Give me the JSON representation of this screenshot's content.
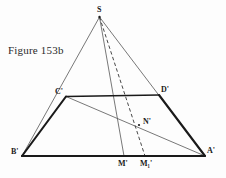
{
  "figure": {
    "caption": "Figure 153b",
    "type": "euclidean-geometry-construction",
    "background_color": "#fdfdfd",
    "stroke_color": "#1a1a1a",
    "thin_stroke_color": "#555555",
    "points": [
      {
        "id": "S",
        "label": "S",
        "x": 99.5,
        "y": 17.0,
        "label_x": 97.0,
        "label_y": 6.0
      },
      {
        "id": "Cp",
        "label": "C'",
        "x": 66.0,
        "y": 96.5,
        "label_x": 55.0,
        "label_y": 88.0
      },
      {
        "id": "Dp",
        "label": "D'",
        "x": 159.0,
        "y": 95.0,
        "label_x": 161.0,
        "label_y": 86.0
      },
      {
        "id": "Bp",
        "label": "B'",
        "x": 22.0,
        "y": 156.0,
        "label_x": 11.0,
        "label_y": 148.0
      },
      {
        "id": "Ap",
        "label": "A'",
        "x": 205.0,
        "y": 156.0,
        "label_x": 207.0,
        "label_y": 147.0
      },
      {
        "id": "Np",
        "label": "N'",
        "x": 139.0,
        "y": 125.0,
        "label_x": 143.0,
        "label_y": 118.0
      },
      {
        "id": "Mp",
        "label": "M'",
        "x": 124.0,
        "y": 156.0,
        "label_x": 118.0,
        "label_y": 160.0
      },
      {
        "id": "M1p",
        "label": "M₁'",
        "x": 145.0,
        "y": 156.0,
        "label_x": 140.0,
        "label_y": 160.0
      }
    ],
    "segments": [
      {
        "name": "base-B-prime-A-prime",
        "from": "Bp",
        "to": "Ap",
        "style": "bold"
      },
      {
        "name": "side-B-prime-C-prime",
        "from": "Bp",
        "to": "Cp",
        "style": "bold"
      },
      {
        "name": "side-D-prime-A-prime",
        "from": "Dp",
        "to": "Ap",
        "style": "bold"
      },
      {
        "name": "midline-C-prime-D-prime",
        "from": "Cp",
        "to": "Dp",
        "style": "bold"
      },
      {
        "name": "ray-S-to-B-prime",
        "from": "S",
        "to": "Bp",
        "style": "thin"
      },
      {
        "name": "ray-S-to-A-prime",
        "from": "S",
        "to": "Ap",
        "style": "thin"
      },
      {
        "name": "cevian-S-to-M-prime",
        "from": "S",
        "to": "Mp",
        "style": "thin"
      },
      {
        "name": "cevian-C-prime-to-A-prime",
        "from": "Cp",
        "to": "Ap",
        "style": "thin"
      },
      {
        "name": "dashed-S-to-M1-prime",
        "from": "S",
        "to": "M1p",
        "style": "dashed"
      }
    ]
  }
}
